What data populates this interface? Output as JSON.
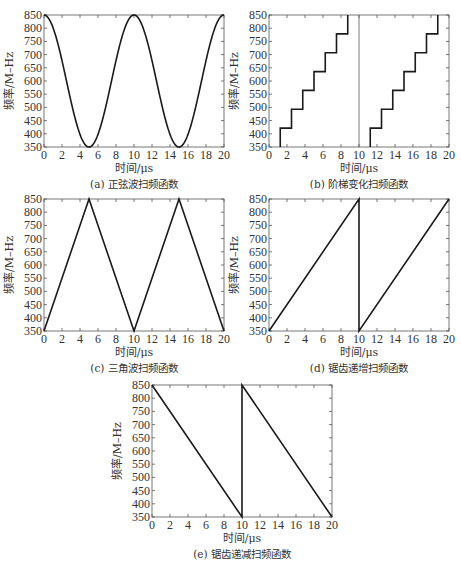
{
  "chart_data": [
    {
      "id": "a",
      "type": "line",
      "title": "(a) 正弦波扫频函数",
      "xlabel": "时间/μs",
      "ylabel": "频率/M–Hz",
      "xlim": [
        0,
        20
      ],
      "ylim": [
        350,
        850
      ],
      "xticks": [
        0,
        2,
        4,
        6,
        8,
        10,
        12,
        14,
        16,
        18,
        20
      ],
      "yticks": [
        350,
        400,
        450,
        500,
        550,
        600,
        650,
        700,
        750,
        800,
        850
      ],
      "grid": false,
      "series": [
        {
          "name": "sine sweep",
          "function": "600 + 250*cos(2*pi*t/10)",
          "x": [
            0,
            1,
            2,
            3,
            4,
            5,
            6,
            7,
            8,
            9,
            10,
            11,
            12,
            13,
            14,
            15,
            16,
            17,
            18,
            19,
            20
          ],
          "y": [
            850,
            802.3,
            677.3,
            522.7,
            397.7,
            350,
            397.7,
            522.7,
            677.3,
            802.3,
            850,
            802.3,
            677.3,
            522.7,
            397.7,
            350,
            397.7,
            522.7,
            677.3,
            802.3,
            850
          ]
        }
      ],
      "extra_lines": []
    },
    {
      "id": "b",
      "type": "line",
      "title": "(b) 阶梯变化扫频函数",
      "xlabel": "时间/μs",
      "ylabel": "频率/M–Hz",
      "xlim": [
        0,
        20
      ],
      "ylim": [
        350,
        850
      ],
      "xticks": [
        0,
        2,
        4,
        6,
        8,
        10,
        12,
        14,
        16,
        18,
        20
      ],
      "yticks": [
        350,
        400,
        450,
        500,
        550,
        600,
        650,
        700,
        750,
        800,
        850
      ],
      "grid": false,
      "series": [
        {
          "name": "staircase sweep 1",
          "x": [
            1.25,
            1.25,
            2.5,
            2.5,
            3.75,
            3.75,
            5,
            5,
            6.25,
            6.25,
            7.5,
            7.5,
            8.75,
            8.75
          ],
          "y": [
            350,
            421.4,
            421.4,
            492.9,
            492.9,
            564.3,
            564.3,
            635.7,
            635.7,
            707.1,
            707.1,
            778.6,
            778.6,
            850
          ]
        },
        {
          "name": "staircase sweep 2",
          "x": [
            11.25,
            11.25,
            12.5,
            12.5,
            13.75,
            13.75,
            15,
            15,
            16.25,
            16.25,
            17.5,
            17.5,
            18.75,
            18.75
          ],
          "y": [
            350,
            421.4,
            421.4,
            492.9,
            492.9,
            564.3,
            564.3,
            635.7,
            635.7,
            707.1,
            707.1,
            778.6,
            778.6,
            850
          ]
        }
      ],
      "extra_lines": [
        {
          "name": "period divider",
          "x": [
            10,
            10
          ],
          "y": [
            350,
            850
          ]
        }
      ]
    },
    {
      "id": "c",
      "type": "line",
      "title": "(c) 三角波扫频函数",
      "xlabel": "时间/μs",
      "ylabel": "频率/M–Hz",
      "xlim": [
        0,
        20
      ],
      "ylim": [
        350,
        850
      ],
      "xticks": [
        0,
        2,
        4,
        6,
        8,
        10,
        12,
        14,
        16,
        18,
        20
      ],
      "yticks": [
        350,
        400,
        450,
        500,
        550,
        600,
        650,
        700,
        750,
        800,
        850
      ],
      "grid": false,
      "series": [
        {
          "name": "triangle sweep",
          "x": [
            0,
            5,
            10,
            15,
            20
          ],
          "y": [
            350,
            850,
            350,
            850,
            350
          ]
        }
      ],
      "extra_lines": []
    },
    {
      "id": "d",
      "type": "line",
      "title": "(d) 锯齿递增扫频函数",
      "xlabel": "时间/μs",
      "ylabel": "频率/M–Hz",
      "xlim": [
        0,
        20
      ],
      "ylim": [
        350,
        850
      ],
      "xticks": [
        0,
        2,
        4,
        6,
        8,
        10,
        12,
        14,
        16,
        18,
        20
      ],
      "yticks": [
        350,
        400,
        450,
        500,
        550,
        600,
        650,
        700,
        750,
        800,
        850
      ],
      "grid": false,
      "series": [
        {
          "name": "rising sawtooth sweep",
          "x": [
            0,
            10,
            10,
            20
          ],
          "y": [
            350,
            850,
            350,
            850
          ]
        }
      ],
      "extra_lines": []
    },
    {
      "id": "e",
      "type": "line",
      "title": "(e) 锯齿递减扫频函数",
      "xlabel": "时间/μs",
      "ylabel": "频率/M–Hz",
      "xlim": [
        0,
        20
      ],
      "ylim": [
        350,
        850
      ],
      "xticks": [
        0,
        2,
        4,
        6,
        8,
        10,
        12,
        14,
        16,
        18,
        20
      ],
      "yticks": [
        350,
        400,
        450,
        500,
        550,
        600,
        650,
        700,
        750,
        800,
        850
      ],
      "grid": false,
      "series": [
        {
          "name": "falling sawtooth sweep",
          "x": [
            0,
            10,
            10,
            20
          ],
          "y": [
            850,
            350,
            850,
            350
          ]
        }
      ],
      "extra_lines": []
    }
  ],
  "colors": {
    "line": "#1a1a1a",
    "frame": "#555555",
    "text": "#333333"
  }
}
